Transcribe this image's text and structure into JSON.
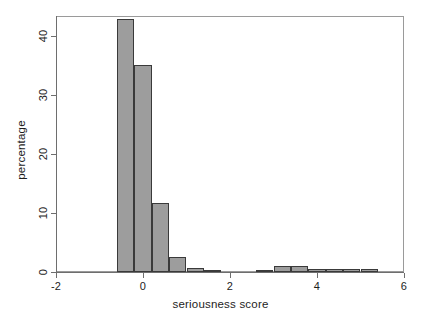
{
  "chart_data": {
    "type": "bar",
    "title": "",
    "subtitle": "",
    "xlabel": "seriousness score",
    "ylabel": "percentage",
    "xlim": [
      -2.2,
      6.2
    ],
    "ylim": [
      0,
      44
    ],
    "grid": false,
    "legend": null,
    "bin_width": 0.4,
    "xticks": [
      -2,
      0,
      2,
      4,
      6
    ],
    "xticklabels": [
      "-2",
      "0",
      "2",
      "4",
      "6"
    ],
    "yticks": [
      0,
      10,
      20,
      30,
      40
    ],
    "yticklabels": [
      "0",
      "10",
      "20",
      "30",
      "40"
    ],
    "bar_fill": "#9d9d9d",
    "bar_border": "#3a3a3a",
    "axis_color": "#6e6e6e",
    "bins": [
      {
        "x0": -0.6,
        "x1": -0.2,
        "value": 42.8
      },
      {
        "x0": -0.2,
        "x1": 0.2,
        "value": 35.1
      },
      {
        "x0": 0.2,
        "x1": 0.6,
        "value": 11.7
      },
      {
        "x0": 0.6,
        "x1": 1.0,
        "value": 2.5
      },
      {
        "x0": 1.0,
        "x1": 1.4,
        "value": 0.6
      },
      {
        "x0": 1.4,
        "x1": 1.8,
        "value": 0.2
      },
      {
        "x0": 1.8,
        "x1": 2.2,
        "value": 0.0
      },
      {
        "x0": 2.2,
        "x1": 2.6,
        "value": 0.0
      },
      {
        "x0": 2.6,
        "x1": 3.0,
        "value": 0.3
      },
      {
        "x0": 3.0,
        "x1": 3.4,
        "value": 1.0
      },
      {
        "x0": 3.4,
        "x1": 3.8,
        "value": 1.0
      },
      {
        "x0": 3.8,
        "x1": 4.2,
        "value": 0.5
      },
      {
        "x0": 4.2,
        "x1": 4.6,
        "value": 0.5
      },
      {
        "x0": 4.6,
        "x1": 5.0,
        "value": 0.5
      },
      {
        "x0": 5.0,
        "x1": 5.4,
        "value": 0.5
      }
    ]
  }
}
